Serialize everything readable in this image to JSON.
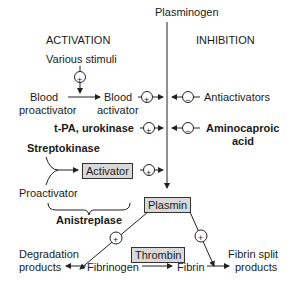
{
  "diagram": {
    "headers": {
      "activation": "ACTIVATION",
      "inhibition": "INHIBITION"
    },
    "top": "Plasminogen",
    "nodes": {
      "various_stimuli": "Various stimuli",
      "blood_proactivator_1": "Blood",
      "blood_proactivator_2": "proactivator",
      "blood_activator_1": "Blood",
      "blood_activator_2": "activator",
      "antiactivators": "Antiactivators",
      "tpa_urokinase": "t-PA, urokinase",
      "aminocaproic_1": "Aminocaproic",
      "aminocaproic_2": "acid",
      "streptokinase": "Streptokinase",
      "activator": "Activator",
      "proactivator": "Proactivator",
      "anistreplase": "Anistreplase",
      "plasmin": "Plasmin",
      "thrombin": "Thrombin",
      "degradation_1": "Degradation",
      "degradation_2": "products",
      "fibrinogen": "Fibrinogen",
      "fibrin": "Fibrin",
      "fibrin_split_1": "Fibrin split",
      "fibrin_split_2": "products"
    },
    "symbols": {
      "plus": "+",
      "minus": "−"
    }
  }
}
